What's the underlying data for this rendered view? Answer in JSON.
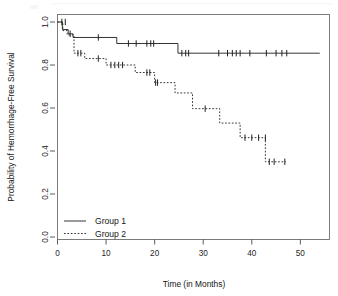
{
  "figure": {
    "background_color": "#ffffff",
    "line_color": "#2b2b2b",
    "frame_color": "#6e6e6e"
  },
  "axes": {
    "x_title": "Time (in Months)",
    "y_title": "Probability of Hemorrhage-Free Survival",
    "x_tick_labels": [
      "0",
      "10",
      "20",
      "30",
      "40",
      "50"
    ],
    "y_tick_labels": [
      "0.0",
      "0.2",
      "0.4",
      "0.6",
      "0.8",
      "1.0"
    ]
  },
  "legend": {
    "entries": [
      {
        "label": "Group 1",
        "style": "solid"
      },
      {
        "label": "Group 2",
        "style": "dashed"
      }
    ]
  },
  "chart_data": {
    "type": "line",
    "title": "",
    "xlabel": "Time (in Months)",
    "ylabel": "Probability of Hemorrhage-Free Survival",
    "xlim": [
      0,
      56
    ],
    "ylim": [
      0.0,
      1.0
    ],
    "x_ticks": [
      0,
      10,
      20,
      30,
      40,
      50
    ],
    "y_ticks": [
      0.0,
      0.2,
      0.4,
      0.6,
      0.8,
      1.0
    ],
    "grid": false,
    "legend_position": "bottom-left",
    "plot_style": "kaplan-meier step function with censoring tick marks",
    "series": [
      {
        "name": "Group 1",
        "style": "solid",
        "steps": [
          {
            "time": 0.0,
            "survival": 1.0
          },
          {
            "time": 1.0,
            "survival": 0.965
          },
          {
            "time": 2.2,
            "survival": 0.945
          },
          {
            "time": 3.2,
            "survival": 0.928
          },
          {
            "time": 12.2,
            "survival": 0.9
          },
          {
            "time": 24.8,
            "survival": 0.855
          },
          {
            "time": 54.0,
            "survival": 0.855
          }
        ],
        "censor_times": [
          0.9,
          1.6,
          2.6,
          8.4,
          14.6,
          16.2,
          18.4,
          19.2,
          19.8,
          25.6,
          26.4,
          27.0,
          33.2,
          35.0,
          36.0,
          36.8,
          37.6,
          39.6,
          43.0,
          45.0,
          46.2,
          47.2
        ],
        "censor_survivals": [
          1.0,
          1.0,
          0.945,
          0.928,
          0.9,
          0.9,
          0.9,
          0.9,
          0.9,
          0.855,
          0.855,
          0.855,
          0.855,
          0.855,
          0.855,
          0.855,
          0.855,
          0.855,
          0.855,
          0.855,
          0.855,
          0.855
        ]
      },
      {
        "name": "Group 2",
        "style": "dashed",
        "steps": [
          {
            "time": 0.0,
            "survival": 1.0
          },
          {
            "time": 1.1,
            "survival": 0.96
          },
          {
            "time": 2.0,
            "survival": 0.94
          },
          {
            "time": 3.4,
            "survival": 0.855
          },
          {
            "time": 5.6,
            "survival": 0.83
          },
          {
            "time": 10.0,
            "survival": 0.8
          },
          {
            "time": 16.0,
            "survival": 0.765
          },
          {
            "time": 20.0,
            "survival": 0.718
          },
          {
            "time": 24.2,
            "survival": 0.67
          },
          {
            "time": 27.8,
            "survival": 0.597
          },
          {
            "time": 33.4,
            "survival": 0.53
          },
          {
            "time": 37.6,
            "survival": 0.462
          },
          {
            "time": 42.8,
            "survival": 0.35
          },
          {
            "time": 47.0,
            "survival": 0.35
          }
        ],
        "censor_times": [
          4.2,
          4.8,
          8.4,
          11.0,
          11.8,
          12.6,
          13.4,
          18.4,
          19.0,
          20.2,
          20.6,
          30.4,
          38.6,
          40.0,
          41.4,
          42.8,
          43.6,
          44.6,
          46.8
        ],
        "censor_survivals": [
          0.855,
          0.855,
          0.83,
          0.8,
          0.8,
          0.8,
          0.8,
          0.765,
          0.765,
          0.718,
          0.718,
          0.597,
          0.462,
          0.462,
          0.462,
          0.462,
          0.35,
          0.35,
          0.35
        ]
      }
    ]
  }
}
